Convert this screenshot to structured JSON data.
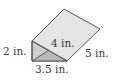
{
  "figure": {
    "type": "triangular-prism",
    "labels": {
      "height": "2 in.",
      "base": "3.5 in.",
      "hypotenuse": "4 in.",
      "length": "5 in."
    },
    "colors": {
      "top_face": "#e4e4e4",
      "front_face_light": "#cfcfcf",
      "front_face_dark": "#b8b8b8",
      "edge": "#555555"
    }
  }
}
